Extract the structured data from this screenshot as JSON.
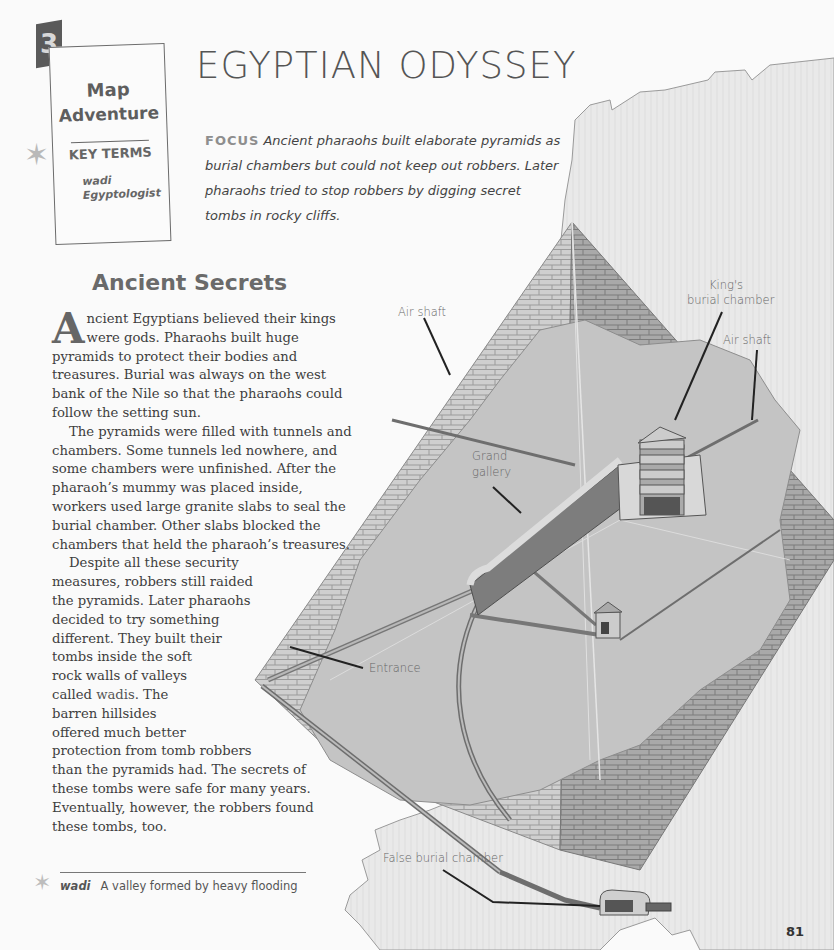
{
  "chapter": {
    "number": "3",
    "box": {
      "line1": "Map",
      "line2": "Adventure",
      "key_terms_label": "KEY TERMS",
      "terms": [
        "wadi",
        "Egyptologist"
      ]
    }
  },
  "page_title": "EGYPTIAN ODYSSEY",
  "focus": {
    "label": "FOCUS",
    "text": "Ancient pharaohs built elaborate pyramids as burial chambers but could not keep out robbers. Later pharaohs tried to stop robbers by digging secret tombs in rocky cliffs."
  },
  "section": {
    "heading": "Ancient Secrets",
    "dropcap": "A",
    "paragraphs": [
      "ncient Egyptians believed their kings were gods. Pharaohs built huge pyramids to protect their bodies and treasures. Burial was always on the west bank of the Nile so that the pharaohs could follow the setting sun.",
      "The pyramids were filled with tunnels and chambers. Some tunnels led nowhere, and some chambers were unfinished. After the pharaoh’s mummy was placed inside, workers used large granite slabs to seal the burial chamber. Other slabs blocked the chambers that held the pharaoh’s treasures."
    ],
    "p3_lines": [
      "Despite all these security",
      "measures, robbers still raided",
      "the pyramids. Later pharaohs",
      "decided to try something",
      "different. They built their",
      "tombs inside the soft",
      "rock walls of valleys"
    ],
    "p3_called": "called ",
    "p3_term": "wadis",
    "p3_after_term": ". The",
    "p3_rest_lines": [
      "barren hillsides",
      "offered much better",
      "protection from tomb robbers",
      "than the pyramids had. The secrets of",
      "these tombs were safe for many years.",
      "Eventually, however, the robbers found",
      "these tombs, too."
    ]
  },
  "glossary": {
    "term": "wadi",
    "definition": "A valley formed by heavy flooding"
  },
  "diagram": {
    "labels": {
      "air_shaft_left": "Air shaft",
      "kings_chamber_1": "King's",
      "kings_chamber_2": "burial chamber",
      "air_shaft_right": "Air shaft",
      "grand_gallery_1": "Grand",
      "grand_gallery_2": "gallery",
      "entrance": "Entrance",
      "false_chamber": "False burial chamber"
    }
  },
  "page_number": "81"
}
